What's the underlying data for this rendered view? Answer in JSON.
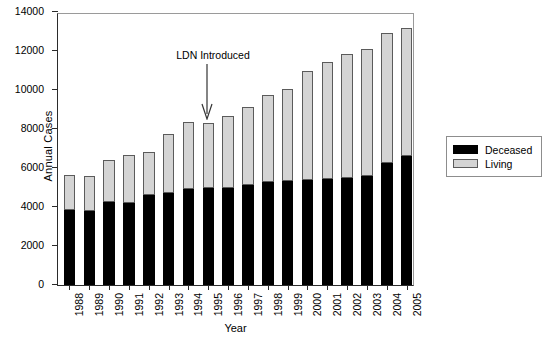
{
  "chart_data": {
    "type": "bar",
    "stacked": true,
    "title": "",
    "xlabel": "Year",
    "ylabel": "Annual Cases",
    "ylim": [
      0,
      14000
    ],
    "yticks": [
      0,
      2000,
      4000,
      6000,
      8000,
      10000,
      12000,
      14000
    ],
    "grid": false,
    "legend_position": "right",
    "categories": [
      "1988",
      "1989",
      "1990",
      "1991",
      "1992",
      "1993",
      "1994",
      "1995",
      "1996",
      "1997",
      "1998",
      "1999",
      "2000",
      "2001",
      "2002",
      "2003",
      "2004",
      "2005"
    ],
    "series": [
      {
        "name": "Deceased",
        "color": "#000000",
        "values": [
          3850,
          3820,
          4250,
          4220,
          4600,
          4700,
          4900,
          4950,
          5000,
          5150,
          5300,
          5350,
          5400,
          5450,
          5500,
          5600,
          6250,
          6600
        ]
      },
      {
        "name": "Living",
        "color": "#d4d4d4",
        "values": [
          1800,
          1780,
          2150,
          2450,
          2200,
          3050,
          3450,
          3350,
          3650,
          4000,
          4450,
          4700,
          5600,
          6000,
          6350,
          6500,
          6650,
          6600
        ]
      }
    ],
    "totals": [
      5650,
      5600,
      6400,
      6670,
      6800,
      7750,
      8350,
      8300,
      8650,
      9150,
      9750,
      10050,
      11000,
      11450,
      11850,
      12100,
      12900,
      13200
    ],
    "annotations": [
      {
        "text": "LDN Introduced",
        "points_to_category": "1995",
        "arrow": "down"
      }
    ]
  },
  "legend": {
    "items": [
      {
        "label": "Deceased",
        "swatch": "black-swatch"
      },
      {
        "label": "Living",
        "swatch": "grey-swatch"
      }
    ]
  }
}
